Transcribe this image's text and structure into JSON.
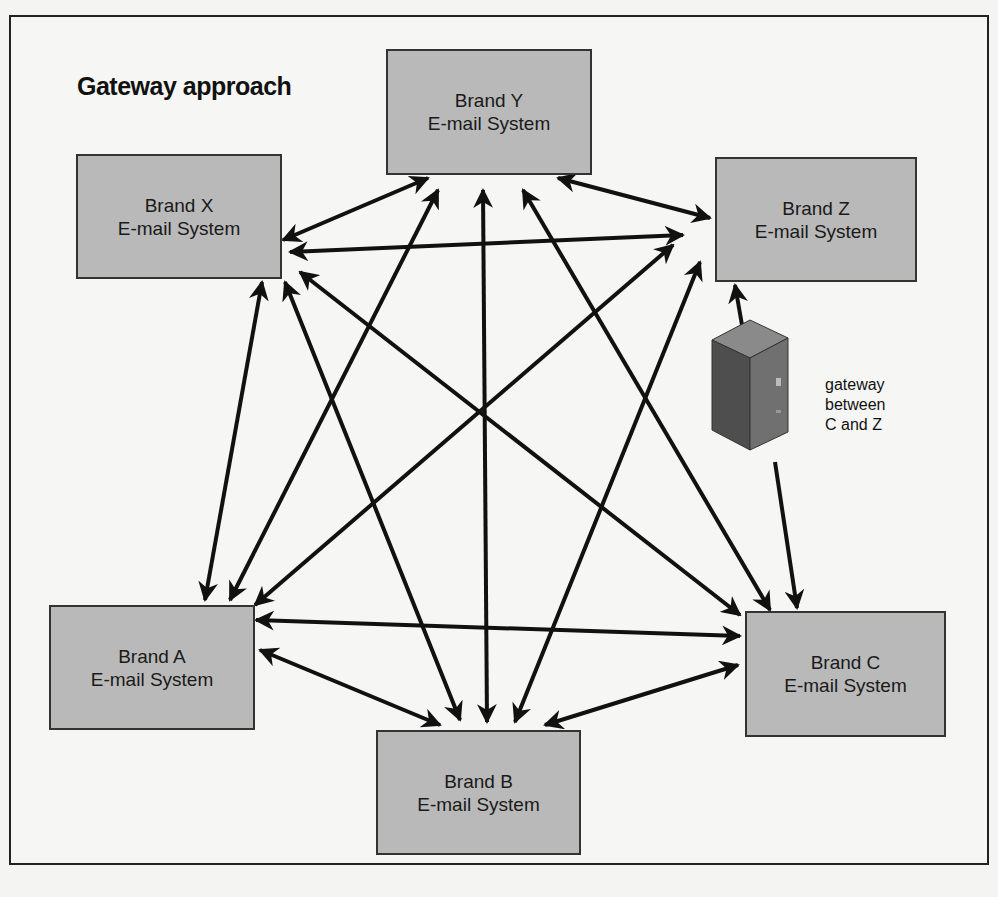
{
  "diagram": {
    "title": "Gateway approach",
    "nodes": [
      {
        "id": "X",
        "line1": "Brand X",
        "line2": "E-mail System"
      },
      {
        "id": "Y",
        "line1": "Brand Y",
        "line2": "E-mail System"
      },
      {
        "id": "Z",
        "line1": "Brand Z",
        "line2": "E-mail System"
      },
      {
        "id": "A",
        "line1": "Brand A",
        "line2": "E-mail System"
      },
      {
        "id": "B",
        "line1": "Brand B",
        "line2": "E-mail System"
      },
      {
        "id": "C",
        "line1": "Brand C",
        "line2": "E-mail System"
      }
    ],
    "gateway": {
      "icon": "server-tower-icon",
      "label_lines": [
        "gateway",
        "between",
        "C and Z"
      ]
    },
    "edges": [
      [
        "X",
        "Y"
      ],
      [
        "X",
        "Z"
      ],
      [
        "X",
        "A"
      ],
      [
        "X",
        "B"
      ],
      [
        "X",
        "C"
      ],
      [
        "Y",
        "Z"
      ],
      [
        "Y",
        "A"
      ],
      [
        "Y",
        "B"
      ],
      [
        "Y",
        "C"
      ],
      [
        "Z",
        "A"
      ],
      [
        "Z",
        "B"
      ],
      [
        "A",
        "B"
      ],
      [
        "A",
        "C"
      ],
      [
        "B",
        "C"
      ],
      [
        "Z",
        "gateway"
      ],
      [
        "gateway",
        "C"
      ]
    ],
    "colors": {
      "box_fill": "#b9b9b9",
      "box_border": "#333333",
      "arrow": "#111111",
      "background": "#f6f6f4"
    }
  }
}
